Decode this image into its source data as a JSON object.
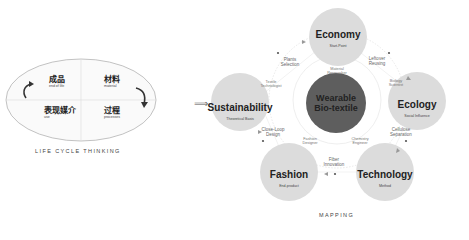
{
  "left_panel": {
    "quadrants": [
      {
        "cn": "成品",
        "en": "end of life"
      },
      {
        "cn": "材料",
        "en": "material"
      },
      {
        "cn": "表现媒介",
        "en": "use"
      },
      {
        "cn": "过程",
        "en": "processes"
      }
    ],
    "caption": "LIFE CYCLE THINKING"
  },
  "right_panel": {
    "center": {
      "line1": "Wearable",
      "line2": "Bio-textile"
    },
    "nodes": [
      {
        "title": "Economy",
        "subtitle": "Start-Point"
      },
      {
        "title": "Ecology",
        "subtitle": "Social Influence"
      },
      {
        "title": "Technology",
        "subtitle": "Method"
      },
      {
        "title": "Fashion",
        "subtitle": "End-product"
      },
      {
        "title": "Sustainability",
        "subtitle": "Theoretical Basis"
      }
    ],
    "outer_labels": {
      "plants_selection": [
        "Plants",
        "Selection"
      ],
      "leftover_reusing": [
        "Leftover",
        "Reusing"
      ],
      "cellulose_separation": [
        "Cellulose",
        "Separation"
      ],
      "fiber_innovation": [
        "Fiber",
        "Innovation"
      ],
      "close_loop_design": [
        "Close-Loop",
        "Design"
      ]
    },
    "inner_labels": {
      "textile_technologist": [
        "Textile",
        "Technologist"
      ],
      "material_researcher": [
        "Material",
        "Researcher"
      ],
      "biology_scientist": [
        "Biology",
        "Scientist"
      ],
      "chemistry_engineer": [
        "Chemistry",
        "Engineer"
      ],
      "fashion_designer": [
        "Fashion",
        "Designer"
      ]
    },
    "arrow_glyph": "⟹",
    "caption": "MAPPING"
  }
}
